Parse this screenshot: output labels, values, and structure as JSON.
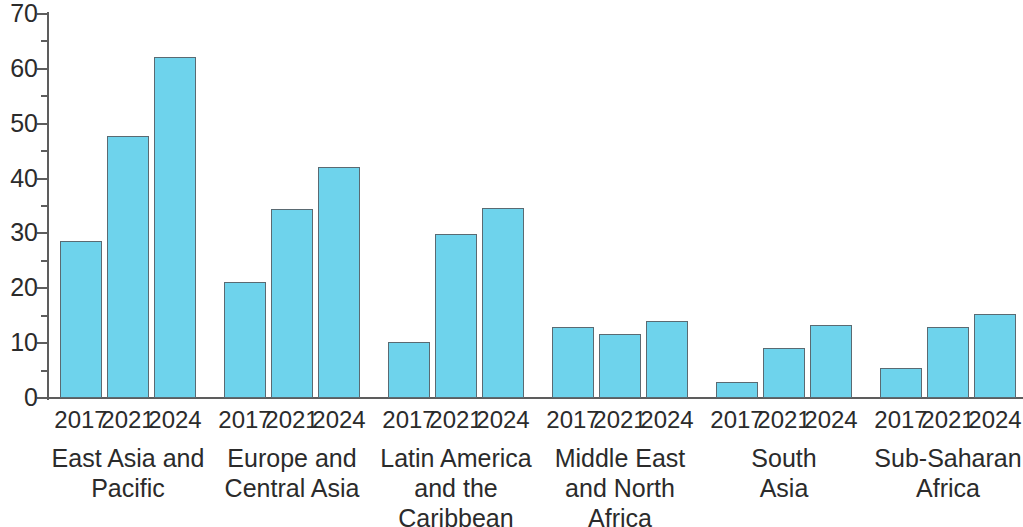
{
  "chart_data": {
    "type": "bar",
    "title": "",
    "subtitle": "",
    "xlabel": "",
    "ylabel": "",
    "ylim": [
      0,
      70
    ],
    "ytick_step": 10,
    "yminor_step": 5,
    "grid": false,
    "legend": "none",
    "bar_color": "#6ed3ec",
    "bar_border_color": "#5a6a72",
    "axis_color": "#5d5d5d",
    "text_color": "#2b2b2b",
    "yticks": [
      "0",
      "10",
      "20",
      "30",
      "40",
      "50",
      "60",
      "70"
    ],
    "categories": [
      "East Asia and Pacific",
      "Europe and Central Asia",
      "Latin America and the Caribbean",
      "Middle East and North Africa",
      "South Asia",
      "Sub-Saharan Africa"
    ],
    "series": [
      {
        "name": "2017",
        "values": [
          28.7,
          21.2,
          10.3,
          13.0,
          2.9,
          5.4
        ]
      },
      {
        "name": "2021",
        "values": [
          47.7,
          34.4,
          29.9,
          11.6,
          9.1,
          13.0
        ]
      },
      {
        "name": "2024",
        "values": [
          62.2,
          42.2,
          34.7,
          14.1,
          13.4,
          15.3
        ]
      }
    ],
    "groups": [
      {
        "label_lines": [
          "East Asia and",
          "Pacific"
        ],
        "bars": [
          {
            "year": "2017",
            "value": 28.7
          },
          {
            "year": "2021",
            "value": 47.7
          },
          {
            "year": "2024",
            "value": 62.2
          }
        ]
      },
      {
        "label_lines": [
          "Europe and",
          "Central Asia"
        ],
        "bars": [
          {
            "year": "2017",
            "value": 21.2
          },
          {
            "year": "2021",
            "value": 34.4
          },
          {
            "year": "2024",
            "value": 42.2
          }
        ]
      },
      {
        "label_lines": [
          "Latin America",
          "and the",
          "Caribbean"
        ],
        "bars": [
          {
            "year": "2017",
            "value": 10.3
          },
          {
            "year": "2021",
            "value": 29.9
          },
          {
            "year": "2024",
            "value": 34.7
          }
        ]
      },
      {
        "label_lines": [
          "Middle East",
          "and North",
          "Africa"
        ],
        "bars": [
          {
            "year": "2017",
            "value": 13.0
          },
          {
            "year": "2021",
            "value": 11.6
          },
          {
            "year": "2024",
            "value": 14.1
          }
        ]
      },
      {
        "label_lines": [
          "South",
          "Asia"
        ],
        "bars": [
          {
            "year": "2017",
            "value": 2.9
          },
          {
            "year": "2021",
            "value": 9.1
          },
          {
            "year": "2024",
            "value": 13.4
          }
        ]
      },
      {
        "label_lines": [
          "Sub-Saharan",
          "Africa"
        ],
        "bars": [
          {
            "year": "2017",
            "value": 5.4
          },
          {
            "year": "2021",
            "value": 13.0
          },
          {
            "year": "2024",
            "value": 15.3
          }
        ]
      }
    ]
  }
}
